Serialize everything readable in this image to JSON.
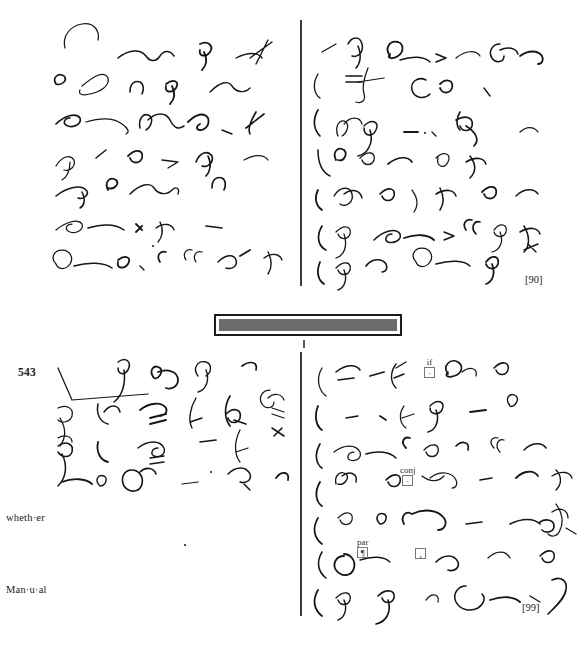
{
  "page": {
    "width": 584,
    "height": 648,
    "background": "#ffffff",
    "ink_color": "#15151a",
    "rule_color": "#3b3b3b"
  },
  "sections": [
    {
      "id": "upper",
      "page_marker": "[90]",
      "columns": [
        {
          "id": "upper-left",
          "lines": 6
        },
        {
          "id": "upper-right",
          "lines": 6
        }
      ]
    },
    {
      "id": "lower",
      "paragraph_number": "543",
      "page_marker": "[99]",
      "columns": [
        {
          "id": "lower-left",
          "lines": 6
        },
        {
          "id": "lower-right",
          "lines": 6
        }
      ],
      "margin_words": [
        {
          "text": "wheth·er"
        },
        {
          "text": "Man·u·al"
        }
      ]
    }
  ],
  "separator_bar": {
    "fill_color": "#6b6b6b",
    "border_color": "#1c1c1c"
  },
  "annotations": [
    {
      "label": "if",
      "mark": "·"
    },
    {
      "label": "conj",
      "mark": "·"
    },
    {
      "label": "par",
      "mark": "¶"
    },
    {
      "label": "",
      "mark": ","
    }
  ],
  "shorthand": {
    "upper_left": [
      "M 65 48 C 62 36 70 26 82 24 C 95 22 100 32 98 40",
      "M 118 58 C 128 50 140 48 146 56 C 150 62 156 62 160 56 C 164 50 170 50 174 56",
      "M 200 44 C 208 40 214 46 210 52 C 206 58 198 56 200 50 M 204 52 C 208 60 206 66 202 70",
      "M 236 58 C 248 52 258 52 262 58 M 268 40 C 262 52 258 60 256 64 M 250 58 L 272 42",
      "M 56 84 C 52 78 58 72 64 76 C 68 80 62 86 56 84",
      "M 82 86 C 94 76 104 70 108 78 C 110 86 100 92 90 94 C 82 96 78 94 80 90",
      "M 130 92 C 130 84 134 80 140 82 C 144 84 144 90 142 94",
      "M 166 84 C 174 78 180 82 176 88 C 172 94 164 92 166 86 M 172 86 C 176 94 174 100 170 104",
      "M 210 92 C 220 82 228 80 232 86 C 236 92 244 94 250 88",
      "M 56 124 C 64 116 76 112 80 118 C 82 124 74 128 68 126 C 62 124 64 118 70 118",
      "M 86 122 C 100 118 114 118 122 124 C 128 128 130 132 126 134",
      "M 140 128 C 138 118 144 112 150 116 C 154 120 150 128 146 130 M 148 120 C 156 112 166 112 170 120 C 174 128 178 130 184 126",
      "M 188 122 C 196 114 204 112 208 118 C 210 124 206 130 200 130 C 196 130 196 126 200 124",
      "M 222 130 L 232 134",
      "M 256 112 C 250 122 248 130 250 134 M 246 128 L 264 114",
      "M 56 166 C 62 156 70 154 74 160 C 76 166 70 172 64 170 M 70 162 C 70 172 66 178 62 180",
      "M 96 158 L 106 150",
      "M 128 156 C 136 148 144 150 142 158 C 140 164 132 164 130 158",
      "M 162 160 L 178 162 L 168 168",
      "M 196 162 C 200 152 208 150 212 156 C 214 162 208 168 202 166 M 208 156 C 212 164 210 172 206 176",
      "M 244 160 C 254 154 264 154 268 160",
      "M 56 196 C 66 188 80 184 86 190 C 90 194 84 200 78 198 M 82 192 C 86 200 84 206 80 208",
      "M 108 190 C 104 182 110 176 116 180 C 120 184 114 190 108 188",
      "M 130 194 C 140 184 150 182 154 188 C 158 194 166 196 172 190 C 176 186 180 188 178 194",
      "M 212 188 C 212 180 216 176 222 178 C 226 180 226 186 224 190",
      "M 56 230 C 66 222 78 218 82 224 C 84 230 76 234 70 232 C 64 230 66 224 72 224",
      "M 88 228 C 102 224 116 224 124 230",
      "M 136 224 L 142 230 M 136 232 L 142 226",
      "M 160 222 C 164 230 162 238 158 242 M 156 228 C 164 222 172 224 174 230",
      "M 206 226 L 222 228",
      "M 56 264 C 50 258 54 250 62 250 C 70 250 74 258 70 264 C 66 270 58 270 56 264",
      "M 74 266 C 88 262 104 262 112 268",
      "M 118 260 C 126 254 132 258 128 264 C 124 270 116 268 118 262",
      "M 140 266 L 144 270",
      "M 160 262 C 156 256 160 250 166 252",
      "M 186 260 C 182 254 186 248 192 250 M 196 262 C 192 256 196 250 202 252",
      "M 218 262 C 226 254 234 254 236 260 C 238 266 232 270 226 268",
      "M 240 256 L 250 250",
      "M 268 252 C 272 260 272 268 268 274 M 264 258 C 272 252 280 254 282 260"
    ],
    "upper_right": [
      "M 322 52 L 336 44",
      "M 348 44 C 352 36 360 36 362 44 C 364 52 358 58 352 56 M 358 46 C 362 56 360 64 356 68",
      "M 390 56 C 384 48 390 40 398 42 C 404 44 404 52 398 56 C 392 60 386 58 390 54",
      "M 400 60 C 412 56 424 56 430 62",
      "M 436 54 L 446 58 L 436 62",
      "M 456 58 C 466 50 476 50 480 56",
      "M 500 44 C 492 44 488 52 492 58 C 496 64 504 62 504 56 M 500 50 C 508 46 516 48 518 54",
      "M 520 56 C 528 50 538 50 542 56 C 544 60 542 64 538 64",
      "M 318 74 C 312 84 314 94 320 98",
      "M 346 76 L 362 76 M 346 82 L 362 82",
      "M 368 68 C 364 78 362 88 364 94 C 366 100 362 104 356 102 M 358 82 L 384 78",
      "M 426 80 C 418 76 410 82 412 90 C 414 98 424 100 430 94",
      "M 440 84 C 446 78 454 80 452 88 C 450 94 442 94 440 88",
      "M 484 88 L 490 96",
      "M 318 110 C 312 120 314 130 320 136",
      "M 338 136 C 334 126 340 118 346 122 C 350 126 346 134 342 136 M 344 124 C 350 116 360 116 362 124",
      "M 364 126 C 372 118 380 122 376 130 C 372 138 364 136 364 128 M 370 130 C 374 142 368 154 358 156",
      "M 404 132 L 418 132",
      "M 432 132 L 436 136",
      "M 460 112 C 456 118 456 126 460 130 M 456 120 C 466 114 474 118 472 126 C 470 132 462 132 460 126 M 466 126 C 476 132 480 140 474 146",
      "M 520 132 C 526 126 534 126 538 132",
      "M 318 150 C 318 162 322 172 330 176",
      "M 336 160 C 332 152 338 146 344 150 C 348 154 344 162 338 160",
      "M 360 158 C 368 150 376 152 374 160 C 372 166 364 166 362 160",
      "M 388 164 C 398 156 408 156 412 162",
      "M 436 158 C 444 150 452 154 448 162 C 444 170 436 166 438 158",
      "M 470 156 C 476 164 476 172 470 178 M 466 162 C 476 156 484 158 486 164",
      "M 318 190 C 314 198 316 206 322 210",
      "M 334 196 C 340 186 350 186 352 194 C 354 202 346 208 340 204 M 344 194 C 352 188 360 190 362 198",
      "M 380 194 C 388 186 396 188 394 196 C 392 202 384 202 382 196",
      "M 412 190 C 418 198 418 206 414 212",
      "M 440 188 C 444 196 444 204 440 210 M 436 194 C 446 188 454 190 456 196",
      "M 482 192 C 490 184 498 186 496 194 C 494 200 486 200 484 194",
      "M 516 196 C 524 188 534 188 538 194",
      "M 322 226 C 316 236 318 246 326 250",
      "M 336 232 C 344 224 352 226 350 234 C 348 240 340 240 338 234 M 344 234 C 348 246 344 256 336 258",
      "M 374 240 C 384 230 396 228 400 234 C 402 240 394 244 388 242 C 384 240 386 234 392 234",
      "M 404 238 C 416 234 428 234 434 240",
      "M 444 232 L 454 236 L 444 240",
      "M 466 230 C 462 224 466 218 472 220 M 476 234 C 470 228 474 220 480 222",
      "M 494 230 C 500 222 508 224 506 232 C 504 238 496 238 494 232 M 500 232 C 504 242 500 250 492 252",
      "M 524 226 C 530 236 530 246 524 252 M 520 232 C 530 226 538 228 540 234",
      "M 320 262 C 316 272 318 280 324 284",
      "M 336 268 C 344 260 352 262 350 270 C 348 276 340 276 338 270 M 344 270 C 348 280 344 288 338 290",
      "M 366 266 C 372 258 382 258 386 264 C 388 268 386 272 382 272",
      "M 416 262 C 410 256 414 248 422 248 C 430 248 434 256 430 262 C 426 268 418 268 416 262",
      "M 436 264 C 450 260 464 260 470 266",
      "M 486 262 C 492 254 500 256 498 264 C 496 270 488 270 486 264 M 492 264 C 496 274 492 282 486 284",
      "M 524 250 L 538 244 M 528 244 L 536 252"
    ],
    "lower_left": [
      "M 58 368 L 72 400 L 148 394",
      "M 118 362 C 126 356 132 362 128 370 C 124 376 118 374 118 368 M 124 370 C 126 384 122 396 114 402",
      "M 154 378 C 148 370 154 364 160 368 C 164 372 158 380 154 378 M 158 372 C 168 368 178 372 178 380 C 178 386 172 390 166 388",
      "M 198 376 C 192 368 198 360 206 362 C 212 364 212 372 206 376 M 206 370 C 210 380 206 390 198 392",
      "M 242 366 C 250 360 258 362 256 370",
      "M 58 408 C 66 404 74 408 72 416 C 70 422 62 424 58 420 M 60 418 C 66 428 66 438 60 446 M 58 438 C 64 434 72 436 72 442",
      "M 98 404 C 96 414 100 422 108 424 M 104 412 C 110 404 118 404 120 412",
      "M 140 410 C 150 402 162 402 166 408 C 168 412 164 416 160 416 M 150 418 L 166 414 M 150 424 L 166 420",
      "M 196 398 C 190 408 188 420 192 428 M 190 422 L 202 418",
      "M 230 396 C 224 406 224 418 230 426 M 226 414 C 234 406 242 410 240 418 C 238 424 230 424 228 418 M 234 420 L 246 424",
      "M 270 390 C 262 390 258 398 262 404 C 266 410 274 408 274 402 M 268 398 C 274 392 282 394 284 400 M 272 408 L 284 412 M 272 414 L 284 418",
      "M 58 446 C 66 440 74 444 72 452 C 70 458 62 458 58 452 M 62 454 C 68 466 66 478 58 486",
      "M 98 442 C 96 452 100 460 108 462",
      "M 138 448 C 148 440 160 440 164 448 C 166 454 160 458 154 456 C 150 454 152 448 158 448 M 150 458 L 164 456 M 150 464 L 164 462",
      "M 200 442 L 216 440",
      "M 240 430 C 234 442 234 454 240 462 M 236 452 L 248 448",
      "M 272 428 L 284 436 M 274 436 L 282 428",
      "M 62 482 C 72 478 86 478 92 484",
      "M 100 486 C 94 480 98 474 104 476 C 108 478 106 486 100 486",
      "M 132 470 C 124 470 120 478 124 486 C 130 494 140 492 142 484 C 144 476 138 470 132 470 M 140 472 C 146 466 154 468 156 474",
      "M 182 484 L 198 482",
      "M 228 474 C 236 466 246 466 250 474 C 252 480 246 484 240 482 M 244 484 L 250 490",
      "M 276 478 C 282 470 290 472 288 480"
    ],
    "lower_right": [
      "M 322 368 C 316 378 318 390 326 396",
      "M 336 372 C 346 364 356 364 360 370 M 338 380 L 354 378",
      "M 370 376 L 384 372",
      "M 396 364 C 390 372 390 382 396 388 M 394 378 L 404 374 M 396 368 L 406 362",
      "M 448 374 C 442 366 450 358 458 362 C 464 366 462 374 454 376 C 448 378 444 376 448 372",
      "M 462 372 C 470 366 478 368 476 376",
      "M 494 368 C 502 360 510 362 508 370 C 506 376 498 376 496 370",
      "M 318 406 C 314 416 316 426 322 430",
      "M 346 418 L 358 416",
      "M 380 416 L 386 420",
      "M 404 406 C 398 414 400 424 406 428 M 402 418 L 414 414",
      "M 430 406 C 438 398 446 402 442 410 C 438 416 430 414 430 408 M 436 410 C 440 420 436 430 428 432",
      "M 470 412 L 486 410",
      "M 510 406 C 504 398 510 392 516 396 C 520 400 514 408 510 406",
      "M 320 444 C 314 454 316 464 322 468",
      "M 334 452 C 344 444 356 444 360 452 C 362 458 356 462 350 460 C 346 458 348 452 354 452",
      "M 366 454 C 378 450 390 452 396 458",
      "M 406 448 C 400 442 404 436 410 438",
      "M 424 450 C 432 442 440 444 438 452 C 436 458 428 458 426 452",
      "M 456 446 C 462 440 470 442 468 450",
      "M 494 448 C 488 442 492 436 498 438 M 500 452 C 494 446 498 438 504 440",
      "M 524 450 C 532 442 542 442 546 448",
      "M 320 482 C 314 492 316 502 322 506",
      "M 336 484 C 334 476 340 470 346 474 C 350 478 344 486 338 484 M 342 476 C 350 470 358 474 356 482",
      "M 386 480 C 394 472 402 474 400 482 C 398 488 390 488 388 482",
      "M 422 476 C 430 482 438 482 444 476 M 430 478 C 440 470 452 472 456 480 C 458 484 456 488 452 488",
      "M 480 480 L 492 478",
      "M 516 478 C 524 470 534 470 538 476",
      "M 556 470 C 562 476 562 484 556 490 M 552 476 C 562 470 570 472 572 478",
      "M 318 518 C 312 528 314 538 322 544",
      "M 338 518 C 346 510 354 512 352 520 C 350 526 342 526 340 520",
      "M 380 524 C 374 518 378 512 384 514 C 388 516 386 524 380 524",
      "M 404 524 C 400 516 406 510 412 514 M 412 514 C 424 508 438 510 444 518 C 448 524 444 530 438 530",
      "M 466 524 L 482 522",
      "M 510 524 C 522 518 534 518 540 524 M 540 522 C 546 518 554 520 554 526 C 554 532 546 534 542 530",
      "M 556 504 C 562 512 564 522 560 530 C 558 536 552 538 548 534 M 552 512 C 560 506 568 510 568 518 M 566 528 L 576 534",
      "M 322 552 C 316 562 318 572 326 578",
      "M 344 556 C 336 556 332 564 336 570 C 342 578 352 576 354 568 C 356 560 350 554 344 554",
      "M 360 560 C 372 556 384 556 390 562",
      "M 436 562 C 444 554 454 554 458 562 C 460 568 454 572 448 570",
      "M 488 558 C 496 550 506 550 510 558",
      "M 540 556 C 548 548 556 550 554 558 C 552 564 544 564 542 558",
      "M 318 590 C 312 600 314 610 322 616",
      "M 336 598 C 344 590 352 592 350 600 C 348 606 340 606 338 600 M 344 600 C 348 610 344 618 338 620",
      "M 378 596 C 386 588 396 590 394 598 C 392 604 384 604 382 598 M 388 600 C 392 612 386 622 376 624",
      "M 426 600 C 432 592 440 594 438 602",
      "M 466 586 C 458 586 452 594 456 602 C 460 610 470 612 478 608 C 484 604 486 598 482 594",
      "M 490 600 C 502 596 514 596 520 602",
      "M 530 596 L 540 602",
      "M 552 580 C 560 576 568 580 566 590 C 564 600 554 608 548 614"
    ]
  }
}
